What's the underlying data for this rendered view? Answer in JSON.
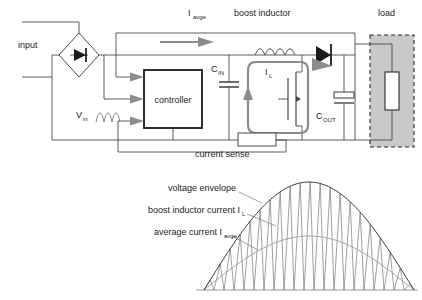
{
  "figure": {
    "colors": {
      "wire": "#4a4a4a",
      "block_outline": "#1a1a1a",
      "gray_loop": "#8c8c8c",
      "load_fill": "#c9c9c9",
      "envelope": "#3a3a3a",
      "ripple": "#6e6e6e",
      "average": "#9a9a9a",
      "background": "#ffffff"
    }
  },
  "schematic": {
    "labels": {
      "input": "input",
      "i_avge_base": "I",
      "i_avge_sub": "avge",
      "boost_inductor": "boost inductor",
      "load": "load",
      "c_in_base": "C",
      "c_in_sub": "IN",
      "c_out_base": "C",
      "c_out_sub": "OUT",
      "i_l_base": "I",
      "i_l_sub": "L",
      "v_in_base": "V",
      "v_in_sub": "in",
      "controller": "controller",
      "current_sense": "current sense"
    },
    "components": [
      "bridge-rectifier",
      "controller-block",
      "input-capacitor",
      "boost-inductor",
      "boost-diode",
      "mosfet-switch",
      "output-capacitor",
      "sense-resistor",
      "load-resistor"
    ]
  },
  "chart_data": {
    "type": "line",
    "title": "",
    "xlabel": "",
    "ylabel": "",
    "grid": false,
    "legend_position": "left-inline-annotations",
    "xlim": [
      0,
      180
    ],
    "ylim": [
      0,
      1
    ],
    "annotations": [
      {
        "text": "voltage envelope",
        "target": "envelope"
      },
      {
        "text": "boost inductor current I",
        "sub": "L",
        "target": "ripple"
      },
      {
        "text": "average current I",
        "sub": "avge",
        "target": "average"
      }
    ],
    "series": [
      {
        "name": "voltage envelope",
        "kind": "half-sine",
        "amplitude": 1.0,
        "x": [
          0,
          15,
          30,
          45,
          60,
          75,
          90,
          105,
          120,
          135,
          150,
          165,
          180
        ],
        "values": [
          0,
          0.259,
          0.5,
          0.707,
          0.866,
          0.966,
          1.0,
          0.966,
          0.866,
          0.707,
          0.5,
          0.259,
          0
        ]
      },
      {
        "name": "average current I_avge",
        "kind": "half-sine",
        "amplitude": 0.5,
        "x": [
          0,
          15,
          30,
          45,
          60,
          75,
          90,
          105,
          120,
          135,
          150,
          165,
          180
        ],
        "values": [
          0,
          0.129,
          0.25,
          0.354,
          0.433,
          0.483,
          0.5,
          0.483,
          0.433,
          0.354,
          0.25,
          0.129,
          0
        ]
      },
      {
        "name": "boost inductor current I_L",
        "kind": "triangular-ripple",
        "cycles": 21,
        "peak_follows": "voltage envelope",
        "valley": 0.0
      }
    ]
  }
}
